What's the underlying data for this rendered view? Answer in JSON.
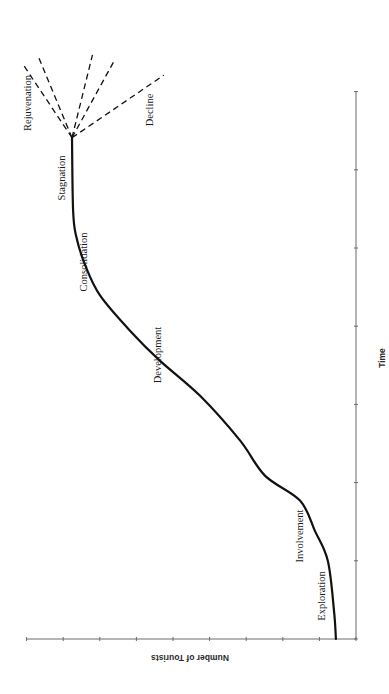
{
  "chart_data": {
    "type": "line",
    "title": "",
    "xlabel": "Time",
    "ylabel": "Number of Tourists",
    "orientation_note": "figure rotated 90° on page",
    "grid": false,
    "legend": null,
    "x_ticks_count": 8,
    "y_ticks_count": 10,
    "xlim": [
      0,
      7
    ],
    "ylim": [
      0,
      9
    ],
    "series": [
      {
        "name": "Tourism area life cycle",
        "style": "solid",
        "x": [
          0,
          0.36,
          1.0,
          1.38,
          1.77,
          2.09,
          2.54,
          3.11,
          3.56,
          3.94,
          4.39,
          4.78,
          5.16,
          5.48,
          6.41
        ],
        "y": [
          0.55,
          0.6,
          0.77,
          1.12,
          1.53,
          2.49,
          3.17,
          4.26,
          5.36,
          6.17,
          6.99,
          7.4,
          7.65,
          7.73,
          7.76
        ]
      },
      {
        "name": "Rejuvenation A",
        "style": "dashed",
        "x": [
          6.41,
          7.35
        ],
        "y": [
          7.76,
          9.1
        ]
      },
      {
        "name": "Rejuvenation B",
        "style": "dashed",
        "x": [
          6.41,
          7.47
        ],
        "y": [
          7.76,
          8.7
        ]
      },
      {
        "name": "Intermediate A",
        "style": "dashed",
        "x": [
          6.41,
          7.47
        ],
        "y": [
          7.76,
          7.2
        ]
      },
      {
        "name": "Intermediate B",
        "style": "dashed",
        "x": [
          6.41,
          7.4
        ],
        "y": [
          7.76,
          6.6
        ]
      },
      {
        "name": "Decline",
        "style": "dashed",
        "x": [
          6.41,
          7.21
        ],
        "y": [
          7.76,
          5.25
        ]
      }
    ],
    "annotations": [
      {
        "text": "Exploration",
        "x": 0.55,
        "y": 0.9
      },
      {
        "text": "Involvement",
        "x": 1.3,
        "y": 1.5
      },
      {
        "text": "Development",
        "x": 3.6,
        "y": 5.4
      },
      {
        "text": "Consolidation",
        "x": 4.8,
        "y": 7.4
      },
      {
        "text": "Stagnation",
        "x": 5.9,
        "y": 8.0
      },
      {
        "text": "Rejuvenation",
        "x": 6.85,
        "y": 8.95
      },
      {
        "text": "Decline",
        "x": 6.76,
        "y": 5.65
      }
    ]
  },
  "labels": {
    "xlabel": "Time",
    "ylabel": "Number of Tourists",
    "stages": {
      "exploration": "Exploration",
      "involvement": "Involvement",
      "development": "Development",
      "consolidation": "Consolidation",
      "stagnation": "Stagnation",
      "rejuvenation": "Rejuvenation",
      "decline": "Decline"
    }
  },
  "colors": {
    "curve": "#111111",
    "axis": "#6a6a6a",
    "text": "#1a1a1a",
    "background": "#ffffff"
  }
}
